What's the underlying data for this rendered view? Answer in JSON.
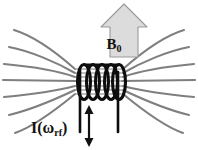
{
  "figure": {
    "background_color": "#ffffff",
    "width": 198,
    "height": 150
  },
  "labels": {
    "b0": {
      "text": "B",
      "subscript": "0",
      "full": "B0",
      "color": "#111111"
    },
    "current": {
      "prefix": "I(",
      "omega": "ω",
      "subscript": "rf",
      "suffix": ")",
      "full": "I(ωrf)",
      "color": "#111111"
    }
  },
  "arrow_b0": {
    "name": "B0 field direction arrow",
    "direction": "up",
    "fill_color": "#dcdcdc",
    "stroke_color": "#9a9a9a"
  },
  "arrow_current": {
    "name": "oscillating current double arrow",
    "direction": "up-down",
    "color": "#111111"
  },
  "coil": {
    "name": "rf solenoid coil",
    "turns": 5,
    "color": "#0d0d0d",
    "lead_wires": 2
  },
  "field_lines": {
    "name": "magnetic field lines",
    "color": "#7f7f7f",
    "count_per_side": 7,
    "stroke_width": 2.1
  }
}
